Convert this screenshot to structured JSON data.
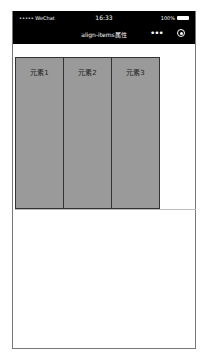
{
  "statusbar": {
    "carrier": "••••• WeChat",
    "wifi_icon": "wifi-icon",
    "time": "16:33",
    "battery_pct": "100%",
    "battery_icon": "battery-icon"
  },
  "navbar": {
    "title": "align-items属性",
    "more_label": "•••",
    "close_icon": "record-icon"
  },
  "container": {
    "items": [
      {
        "label": "元素1"
      },
      {
        "label": "元素2"
      },
      {
        "label": "元素3"
      }
    ],
    "item_color": "#9a9a9a"
  }
}
